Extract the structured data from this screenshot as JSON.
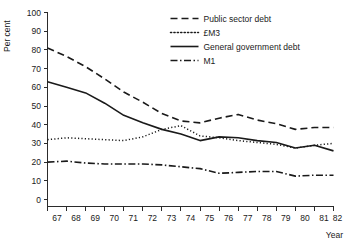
{
  "figure": {
    "background": "#ffffff",
    "ink_color": "#1a1a1a"
  },
  "chart_data": {
    "type": "line",
    "title": "",
    "subtitle": "",
    "xlabel": "Year",
    "ylabel": "Per cent",
    "xlim": [
      67,
      82
    ],
    "ylim": [
      0,
      100
    ],
    "grid": false,
    "legend_position": "top-right",
    "x_tick_labels": [
      "67",
      "68",
      "69",
      "70",
      "71",
      "72",
      "73",
      "74",
      "75",
      "76",
      "77",
      "78",
      "79",
      "80",
      "81",
      "82"
    ],
    "y_tick_labels": [
      "0",
      "10",
      "20",
      "30",
      "40",
      "50",
      "60",
      "70",
      "80",
      "90",
      "100"
    ],
    "y_ticks": [
      0,
      10,
      20,
      30,
      40,
      50,
      60,
      70,
      80,
      90,
      100
    ],
    "x": [
      67,
      68,
      69,
      70,
      71,
      72,
      73,
      74,
      75,
      76,
      77,
      78,
      79,
      80,
      81,
      82
    ],
    "series": [
      {
        "name": "Public sector debt",
        "style": "dashed",
        "dash": "7,4",
        "width": 1.6,
        "values": [
          81.0,
          76.5,
          71.0,
          64.5,
          57.5,
          52.0,
          46.0,
          42.0,
          41.0,
          43.5,
          45.5,
          42.5,
          40.5,
          37.5,
          38.5,
          38.5
        ]
      },
      {
        "name": "£M3",
        "style": "dotted",
        "dash": "1.2,2.2",
        "width": 1.5,
        "values": [
          32.0,
          33.0,
          32.5,
          32.0,
          31.5,
          33.5,
          37.5,
          39.5,
          34.0,
          33.0,
          31.5,
          30.5,
          29.5,
          27.5,
          29.0,
          30.0
        ]
      },
      {
        "name": "General government debt",
        "style": "solid",
        "dash": "",
        "width": 1.6,
        "values": [
          63.0,
          60.0,
          57.0,
          51.5,
          45.0,
          41.0,
          37.5,
          35.0,
          31.5,
          33.5,
          33.0,
          31.5,
          30.5,
          27.5,
          29.0,
          26.0
        ]
      },
      {
        "name": "M1",
        "style": "dash-dot",
        "dash": "7,2.5,1.5,2.5",
        "width": 1.6,
        "values": [
          20.0,
          20.5,
          19.5,
          19.0,
          19.0,
          19.0,
          18.5,
          17.5,
          16.5,
          14.0,
          14.5,
          15.0,
          15.0,
          12.5,
          13.0,
          13.0
        ]
      }
    ],
    "legend_entries": [
      {
        "label": "Public sector debt",
        "style": "dashed"
      },
      {
        "label": "£M3",
        "style": "dotted"
      },
      {
        "label": "General government debt",
        "style": "solid"
      },
      {
        "label": "M1",
        "style": "dash-dot"
      }
    ]
  }
}
